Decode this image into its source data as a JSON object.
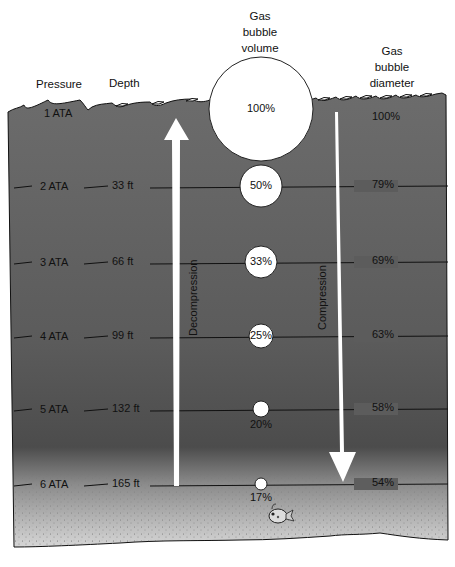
{
  "headers": {
    "pressure": "Pressure",
    "depth": "Depth",
    "volume": [
      "Gas",
      "bubble",
      "volume"
    ],
    "diameter": [
      "Gas",
      "bubble",
      "diameter"
    ]
  },
  "arrows": {
    "decompression": "Decompression",
    "compression": "Compression"
  },
  "colors": {
    "water_top": "#6b6b6b",
    "water_mid": "#5a5a5a",
    "water_deep": "#4a4a4a",
    "seabed": "#d8d8d8",
    "bubble": "#ffffff",
    "text": "#111111"
  },
  "rows": [
    {
      "pressure": "1 ATA",
      "depth": "",
      "volume": "100%",
      "diameter": "100%",
      "y": 115,
      "r": 52,
      "vol_label_inside": true
    },
    {
      "pressure": "2 ATA",
      "depth": "33 ft",
      "volume": "50%",
      "diameter": "79%",
      "y": 186,
      "r": 21,
      "vol_label_inside": true
    },
    {
      "pressure": "3 ATA",
      "depth": "66 ft",
      "volume": "33%",
      "diameter": "69%",
      "y": 262,
      "r": 16,
      "vol_label_inside": true
    },
    {
      "pressure": "4 ATA",
      "depth": "99 ft",
      "volume": "25%",
      "diameter": "63%",
      "y": 336,
      "r": 12,
      "vol_label_inside": true
    },
    {
      "pressure": "5 ATA",
      "depth": "132 ft",
      "volume": "20%",
      "diameter": "58%",
      "y": 409,
      "r": 8,
      "vol_label_inside": false
    },
    {
      "pressure": "6 ATA",
      "depth": "165 ft",
      "volume": "17%",
      "diameter": "54%",
      "y": 484,
      "r": 6,
      "vol_label_inside": false
    }
  ]
}
